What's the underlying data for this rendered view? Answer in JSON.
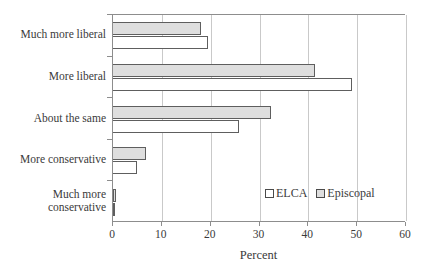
{
  "chart_data": {
    "type": "bar",
    "orientation": "horizontal",
    "title": "",
    "xlabel": "Percent",
    "ylabel": "",
    "xlim": [
      0,
      60
    ],
    "xticks": [
      0,
      10,
      20,
      30,
      40,
      50,
      60
    ],
    "grid": "vertical",
    "legend_position": "inside-lower-right",
    "categories": [
      "Much more liberal",
      "More liberal",
      "About the same",
      "More conservative",
      "Much more\nconservative"
    ],
    "series": [
      {
        "name": "ELCA",
        "color": "#ffffff",
        "edge_color": "#5e5e5e",
        "values": [
          19.5,
          49.0,
          25.8,
          4.9,
          0.5
        ]
      },
      {
        "name": "Episcopal",
        "color": "#dedede",
        "edge_color": "#5e5e5e",
        "values": [
          18.0,
          41.3,
          32.3,
          6.7,
          0.6
        ]
      }
    ]
  },
  "axis": {
    "x_title": "Percent",
    "tick_labels": [
      "0",
      "10",
      "20",
      "30",
      "40",
      "50",
      "60"
    ]
  },
  "legend": {
    "items": [
      {
        "label": "ELCA"
      },
      {
        "label": "Episcopal"
      }
    ]
  },
  "colors": {
    "axis": "#8d8d8d",
    "gridline": "#c9c9c9",
    "bar_edge": "#5e5e5e",
    "episcopal_fill": "#dedede",
    "elca_fill": "#ffffff",
    "text": "#3a3a3a"
  }
}
